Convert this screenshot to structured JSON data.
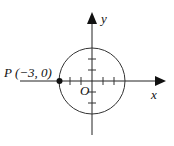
{
  "diagram": {
    "type": "coordinate-circle",
    "axis_x_label": "x",
    "axis_y_label": "y",
    "origin_label": "O",
    "point_label": "P (−3, 0)",
    "point": {
      "name": "P",
      "x": -3,
      "y": 0
    },
    "circle": {
      "center": [
        0,
        0
      ],
      "radius": 3
    },
    "ticks_per_axis_side": 3
  }
}
